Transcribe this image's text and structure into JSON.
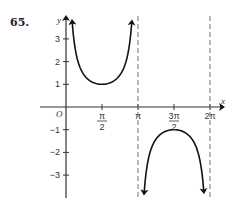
{
  "problem": {
    "number": "65."
  },
  "chart_data": {
    "type": "line",
    "title": "",
    "function": "y = csc x",
    "xlabel": "x",
    "ylabel": "y",
    "origin_label": "O",
    "xlim": [
      0,
      6.2832
    ],
    "ylim": [
      -3.9,
      3.9
    ],
    "grid": false,
    "x_ticks": [
      {
        "value": 1.5708,
        "label_num": "π",
        "label_den": "2"
      },
      {
        "value": 3.1416,
        "label": "π"
      },
      {
        "value": 4.7124,
        "label_num": "3π",
        "label_den": "2"
      },
      {
        "value": 6.2832,
        "label": "2π"
      }
    ],
    "y_ticks": [
      {
        "value": 3,
        "label": "3"
      },
      {
        "value": 2,
        "label": "2"
      },
      {
        "value": 1,
        "label": "1"
      },
      {
        "value": -1,
        "label": "−1"
      },
      {
        "value": -2,
        "label": "−2"
      },
      {
        "value": -3,
        "label": "−3"
      }
    ],
    "asymptotes": [
      {
        "x": 0,
        "label": "x = 0"
      },
      {
        "x": 3.1416,
        "label": "x = π"
      },
      {
        "x": 6.2832,
        "label": "x = 2π"
      }
    ],
    "series": [
      {
        "name": "branch-1",
        "x": [
          0.27,
          0.4,
          0.6,
          0.8,
          1.0,
          1.2,
          1.5708,
          1.94,
          2.14,
          2.34,
          2.54,
          2.74,
          2.87
        ],
        "y": [
          3.73,
          2.57,
          1.77,
          1.39,
          1.19,
          1.07,
          1.0,
          1.07,
          1.19,
          1.39,
          1.77,
          2.57,
          3.73
        ]
      },
      {
        "name": "branch-2",
        "x": [
          3.41,
          3.54,
          3.74,
          3.94,
          4.14,
          4.34,
          4.7124,
          5.08,
          5.28,
          5.48,
          5.68,
          5.88,
          6.01
        ],
        "y": [
          -3.73,
          -2.57,
          -1.77,
          -1.39,
          -1.19,
          -1.07,
          -1.0,
          -1.07,
          -1.19,
          -1.39,
          -1.77,
          -2.57,
          -3.73
        ]
      }
    ]
  }
}
